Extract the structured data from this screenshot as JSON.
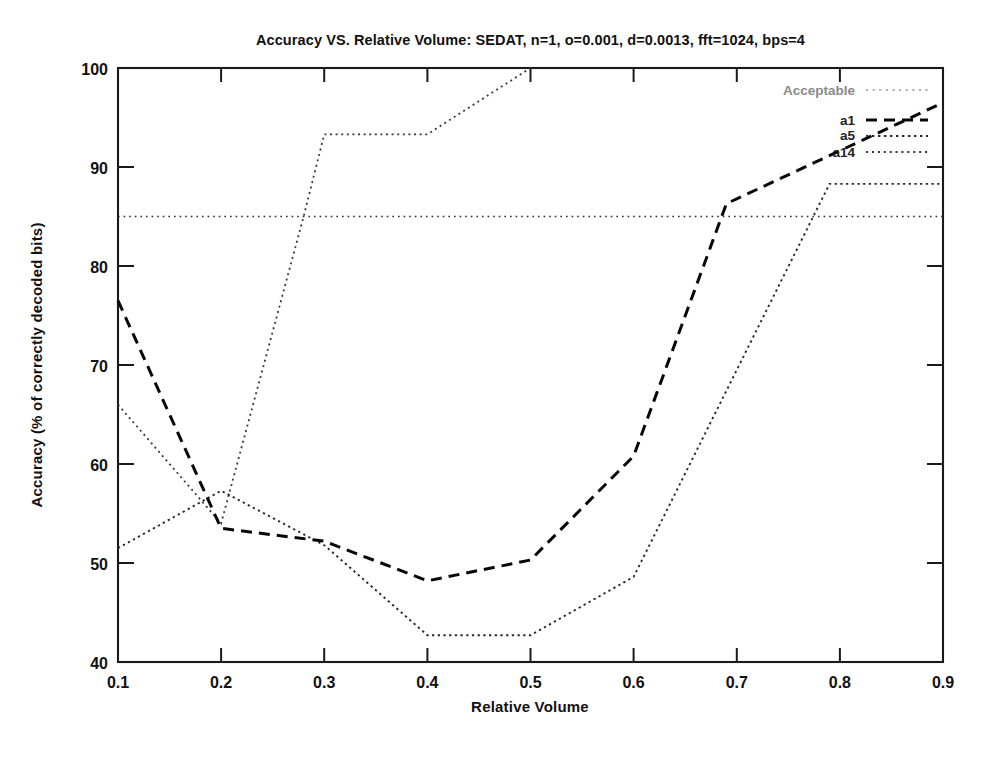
{
  "chart_data": {
    "type": "line",
    "title": "Accuracy VS. Relative Volume: SEDAT, n=1, o=0.001, d=0.0013, fft=1024, bps=4",
    "xlabel": "Relative Volume",
    "ylabel": "Accuracy (% of correctly decoded bits)",
    "xlim": [
      0.1,
      0.9
    ],
    "ylim": [
      40,
      100
    ],
    "xticks": [
      "0.1",
      "0.2",
      "0.3",
      "0.4",
      "0.5",
      "0.6",
      "0.7",
      "0.8",
      "0.9"
    ],
    "xtick_values": [
      0.1,
      0.2,
      0.3,
      0.4,
      0.5,
      0.6,
      0.7,
      0.8,
      0.9
    ],
    "yticks": [
      "40",
      "50",
      "60",
      "70",
      "80",
      "90",
      "100"
    ],
    "ytick_values": [
      40,
      50,
      60,
      70,
      80,
      90,
      100
    ],
    "grid": false,
    "legend_position": "top-right-inside",
    "series": [
      {
        "name": "Acceptable",
        "style": "dotted",
        "x": [
          0.1,
          0.9
        ],
        "values": [
          85,
          85
        ]
      },
      {
        "name": "a1",
        "style": "dashed",
        "x": [
          0.1,
          0.2,
          0.3,
          0.4,
          0.5,
          0.6,
          0.69,
          0.9
        ],
        "values": [
          76.5,
          53.5,
          52.2,
          48.2,
          50.3,
          60.8,
          86.3,
          96.5
        ]
      },
      {
        "name": "a5",
        "style": "dotted",
        "x": [
          0.1,
          0.2,
          0.3,
          0.4,
          0.5,
          0.6,
          0.79,
          0.9
        ],
        "values": [
          51.5,
          57.3,
          51.8,
          42.7,
          42.7,
          48.6,
          88.3,
          88.3
        ]
      },
      {
        "name": "a14",
        "style": "dotted",
        "x": [
          0.1,
          0.2,
          0.28,
          0.3,
          0.4,
          0.5
        ],
        "values": [
          66.0,
          54.0,
          85.0,
          93.3,
          93.3,
          100.0
        ]
      }
    ]
  },
  "legend": {
    "entries": [
      {
        "label": "Acceptable",
        "series": "Acceptable"
      },
      {
        "label": "a1",
        "series": "a1"
      },
      {
        "label": "a5",
        "series": "a5"
      },
      {
        "label": "a14",
        "series": "a14"
      }
    ]
  },
  "colors": {
    "background": "#ffffff",
    "foreground": "#111111",
    "axis": "#1a1a1a",
    "acceptable": "#2b2b2b",
    "a1": "#070707",
    "a5": "#2a2a2a",
    "a14": "#3a3a3a"
  }
}
